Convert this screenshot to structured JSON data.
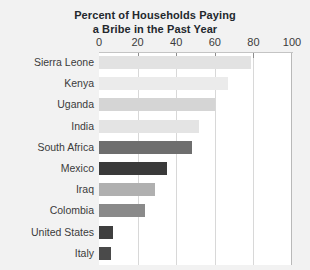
{
  "chart_data": {
    "type": "bar",
    "orientation": "horizontal",
    "title": "Percent of Households Paying a Bribe in the Past Year",
    "title_lines": [
      "Percent of Households Paying",
      "a Bribe in the Past Year"
    ],
    "xlabel": "",
    "ylabel": "",
    "xlim": [
      0,
      100
    ],
    "xticks": [
      0,
      20,
      40,
      60,
      80,
      100
    ],
    "xtick_labels": [
      "0",
      "20",
      "40",
      "60",
      "80",
      "100"
    ],
    "grid": true,
    "legend": "none",
    "categories": [
      "Sierra Leone",
      "Kenya",
      "Uganda",
      "India",
      "South Africa",
      "Mexico",
      "Iraq",
      "Colombia",
      "United States",
      "Italy"
    ],
    "values": [
      79,
      67,
      60,
      52,
      48,
      35,
      29,
      24,
      7,
      6
    ],
    "bar_colors": [
      "#e2e2e2",
      "#ebebeb",
      "#d5d5d5",
      "#e4e4e4",
      "#6e6e6e",
      "#3a3a3a",
      "#b0b0b0",
      "#8a8a8a",
      "#3f3f3f",
      "#4a4a4a"
    ]
  },
  "style": {
    "background": "#f2f2f2",
    "plot_background": "#ffffff",
    "gridline_color": "#d8d8d8",
    "axis_color": "#b9b9b9",
    "text_color": "#3b3b3b",
    "title_color": "#23282d"
  }
}
